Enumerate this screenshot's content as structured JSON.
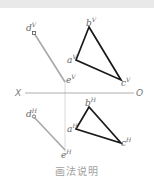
{
  "figure": {
    "caption": "画法说明",
    "axis": {
      "left_label": "X",
      "right_label": "O"
    },
    "colors": {
      "line_segment": "#a8a8a8",
      "triangle": "#1a1a1a",
      "axis": "#9a9a9a",
      "projector": "#cfcfcf",
      "topbar": "#e9e9e9"
    },
    "top_view": {
      "segment": {
        "start_label": "d",
        "start_sup": "V",
        "end_label": "e",
        "end_sup": "V"
      },
      "triangle": {
        "a": "a",
        "a_sup": "V",
        "b": "b",
        "b_sup": "V",
        "c": "c",
        "c_sup": "V"
      }
    },
    "bottom_view": {
      "segment": {
        "start_label": "d",
        "start_sup": "H",
        "end_label": "e",
        "end_sup": "H"
      },
      "triangle": {
        "a": "a",
        "a_sup": "H",
        "b": "b",
        "b_sup": "H",
        "c": "c",
        "c_sup": "H"
      }
    }
  }
}
